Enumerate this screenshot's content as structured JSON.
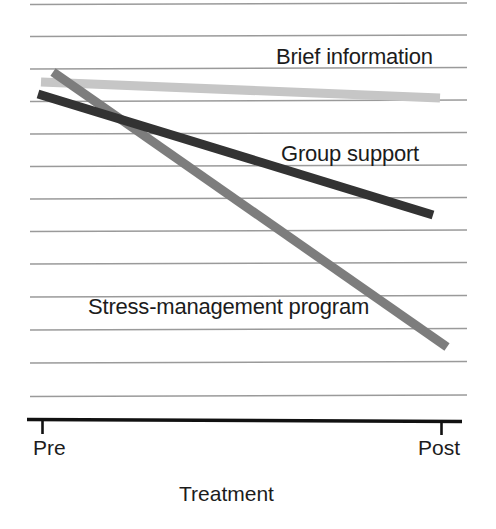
{
  "chart_data": {
    "type": "line",
    "title": "",
    "subtitle": "",
    "xlabel": "Treatment",
    "ylabel": "",
    "x": [
      "Pre",
      "Post"
    ],
    "categories": [
      "Pre",
      "Post"
    ],
    "xtick_labels": [
      "Pre",
      "Post"
    ],
    "ytick_labels": [],
    "xlim": [
      0,
      1
    ],
    "ylim": [
      0,
      13
    ],
    "grid": "horizontal",
    "gridline_count": 13,
    "legend_position": "inline-annotations",
    "series": [
      {
        "name": "Brief information",
        "color": "#c6c6c6",
        "values": [
          10.3,
          9.8
        ],
        "pixel_start": [
          41,
          82
        ],
        "pixel_end": [
          440,
          98
        ],
        "line_width": 9
      },
      {
        "name": "Group support",
        "color": "#333333",
        "values": [
          10.0,
          6.3
        ],
        "pixel_start": [
          38,
          94
        ],
        "pixel_end": [
          433,
          215
        ],
        "line_width": 9
      },
      {
        "name": "Stress-management program",
        "color": "#7d7d7d",
        "values": [
          10.7,
          2.2
        ],
        "pixel_start": [
          53,
          72
        ],
        "pixel_end": [
          447,
          347
        ],
        "line_width": 9
      }
    ],
    "annotations": [
      {
        "text": "Brief information",
        "x": 276,
        "y": 46
      },
      {
        "text": "Group support",
        "x": 281,
        "y": 143
      },
      {
        "text": "Stress-management program",
        "x": 88,
        "y": 296
      }
    ]
  },
  "labels": {
    "brief_information": "Brief information",
    "group_support": "Group support",
    "stress_management": "Stress-management program"
  },
  "axis": {
    "tick_pre": "Pre",
    "tick_post": "Post",
    "title": "Treatment"
  },
  "colors": {
    "gridline": "#9a9a9a",
    "axis": "#111111",
    "text": "#1c1c1c",
    "series_brief_information": "#c6c6c6",
    "series_group_support": "#333333",
    "series_stress_management": "#7d7d7d",
    "background": "#ffffff"
  }
}
